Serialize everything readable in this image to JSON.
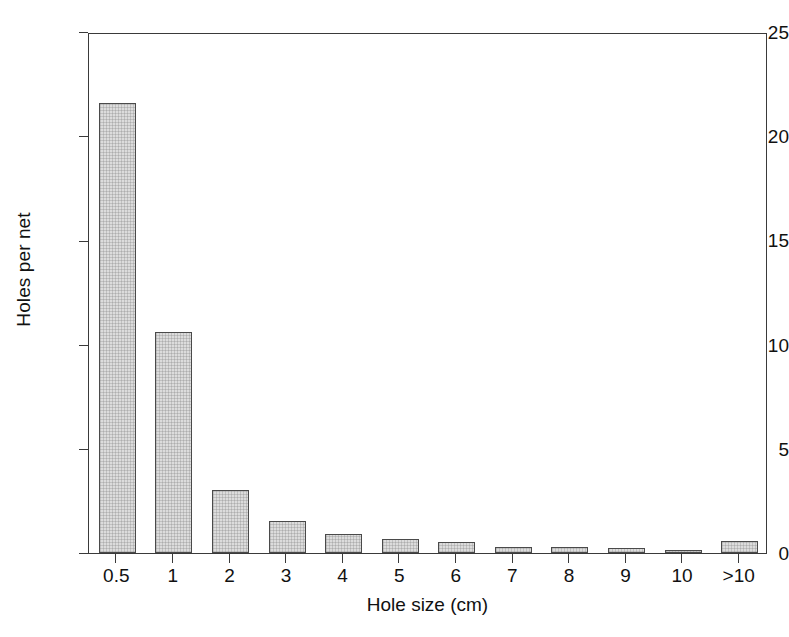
{
  "chart_data": {
    "type": "bar",
    "title": "",
    "subtitle": "",
    "xlabel": "Hole size (cm)",
    "ylabel": "Holes per net",
    "categories": [
      "0.5",
      "1",
      "2",
      "3",
      "4",
      "5",
      "6",
      "7",
      "8",
      "9",
      "10",
      ">10"
    ],
    "values": [
      21.6,
      10.6,
      3.0,
      1.55,
      0.9,
      0.65,
      0.55,
      0.3,
      0.28,
      0.22,
      0.15,
      0.6
    ],
    "series": [
      {
        "name": "Holes per net",
        "values": [
          21.6,
          10.6,
          3.0,
          1.55,
          0.9,
          0.65,
          0.55,
          0.3,
          0.28,
          0.22,
          0.15,
          0.6
        ]
      }
    ],
    "ylim": [
      0,
      25
    ],
    "yticks": [
      0,
      5,
      10,
      15,
      20,
      25
    ],
    "ytick_labels": [
      "0",
      "5",
      "10",
      "15",
      "20",
      "25"
    ],
    "xtick_labels": [
      "0.5",
      "1",
      "2",
      "3",
      "4",
      "5",
      "6",
      "7",
      "8",
      "9",
      "10",
      ">10"
    ],
    "grid": false,
    "legend": false,
    "legend_position": "none",
    "bar_fill_color": "#dcdcdc",
    "bar_edge_color": "#4a4a4a",
    "axis_color": "#3a3a3a",
    "background_color": "#ffffff",
    "annotations": []
  },
  "axis": {
    "y_title": "Holes per net",
    "x_title": "Hole size (cm)"
  }
}
